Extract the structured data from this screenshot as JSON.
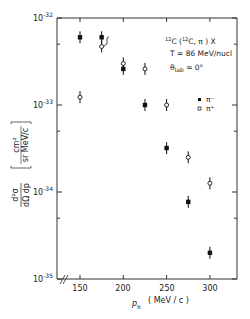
{
  "chart_data": {
    "type": "scatter",
    "title": "",
    "annotations": [
      "12C (12C, π) X",
      "T = 86 MeV/nucl",
      "θlab = 0°"
    ],
    "xlabel": "p_π (MeV/c)",
    "ylabel": "d²σ / dΩ dp [cm² / sr MeV/c]",
    "xlim": [
      130,
      330
    ],
    "ylim": [
      1e-35,
      1e-32
    ],
    "yscale": "log",
    "x_ticks": [
      150,
      200,
      250,
      300
    ],
    "y_ticks": [
      "10^-32",
      "10^-33",
      "10^-34",
      "10^-35"
    ],
    "x_axis_break": true,
    "grid": false,
    "legend": {
      "position": "right-middle",
      "entries": [
        {
          "label": "π⁻",
          "marker": "filled-square"
        },
        {
          "label": "π⁺",
          "marker": "open-circle"
        }
      ]
    },
    "series": [
      {
        "name": "π⁻",
        "marker": "filled-square",
        "x": [
          150,
          175,
          200,
          225,
          250,
          275,
          300
        ],
        "y": [
          6e-33,
          6e-33,
          2.6e-33,
          1e-33,
          3.2e-34,
          7.7e-35,
          2e-35
        ]
      },
      {
        "name": "π⁺",
        "marker": "open-circle",
        "x": [
          150,
          175,
          200,
          225,
          250,
          275,
          300
        ],
        "y": [
          1.23e-33,
          4.7e-33,
          3e-33,
          2.6e-33,
          1e-33,
          2.5e-34,
          1.26e-34
        ]
      }
    ]
  },
  "labels": {
    "annotation_line1_sup1": "12",
    "annotation_line1_a": "C (",
    "annotation_line1_sup2": "12",
    "annotation_line1_b": "C, π ) X",
    "annotation_line2": "T = 86 MeV/nucl",
    "annotation_line3_theta": "θ",
    "annotation_line3_sub": "lab",
    "annotation_line3_rest": " = 0°",
    "legend_pim": "π⁻",
    "legend_pip": "π⁺",
    "xlabel_p": "p",
    "xlabel_sub": "π",
    "xlabel_units": "( MeV / c )",
    "ylabel_num": "d²σ",
    "ylabel_den": "dΩ dp",
    "ylabel_units_num": "cm²",
    "ylabel_units_den": "sr MeV/c",
    "x_tick_labels": [
      "150",
      "200",
      "250",
      "300"
    ],
    "y_tick_base": "10",
    "y_tick_exps": [
      "-32",
      "-33",
      "-34",
      "-35"
    ]
  }
}
